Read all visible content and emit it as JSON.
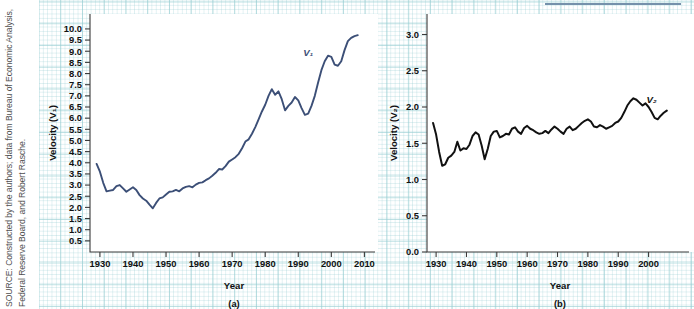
{
  "source_note": "SOURCE: Constructed by the authors; data from Bureau of Economic Analysis, Federal Reserve Board, and Robert Rasche.",
  "panel_a": {
    "subcaption": "(a)",
    "series_label": "V₁",
    "series_color": "#3c4f77"
  },
  "panel_b": {
    "subcaption": "(b)",
    "series_label": "V₂",
    "series_color": "#111111"
  },
  "top_rule_color": "#7591ab",
  "chart_data": [
    {
      "type": "line",
      "panel": "(a)",
      "title": "",
      "xlabel": "Year",
      "ylabel": "Velocity (V₁)",
      "xlim": [
        1927,
        2012
      ],
      "ylim": [
        0,
        10.4
      ],
      "xticks": [
        1930,
        1940,
        1950,
        1960,
        1970,
        1980,
        1990,
        2000,
        2010
      ],
      "yticks": [
        0.5,
        1.0,
        1.5,
        2.0,
        2.5,
        3.0,
        3.5,
        4.0,
        4.5,
        5.0,
        5.5,
        6.0,
        6.5,
        7.0,
        7.5,
        8.0,
        8.5,
        9.0,
        9.5,
        10.0
      ],
      "grid": true,
      "legend": "annotation",
      "annotations": [
        {
          "text": "V₁",
          "x": 1993,
          "y": 8.8
        }
      ],
      "series": [
        {
          "name": "V₁",
          "color": "#3c4f77",
          "x": [
            1929,
            1930,
            1931,
            1932,
            1933,
            1934,
            1935,
            1936,
            1937,
            1938,
            1939,
            1940,
            1941,
            1942,
            1943,
            1944,
            1945,
            1946,
            1947,
            1948,
            1949,
            1950,
            1951,
            1952,
            1953,
            1954,
            1955,
            1956,
            1957,
            1958,
            1959,
            1960,
            1961,
            1962,
            1963,
            1964,
            1965,
            1966,
            1967,
            1968,
            1969,
            1970,
            1971,
            1972,
            1973,
            1974,
            1975,
            1976,
            1977,
            1978,
            1979,
            1980,
            1981,
            1982,
            1983,
            1984,
            1985,
            1986,
            1987,
            1988,
            1989,
            1990,
            1991,
            1992,
            1993,
            1994,
            1995,
            1996,
            1997,
            1998,
            1999,
            2000,
            2001,
            2002,
            2003,
            2004,
            2005,
            2006,
            2007,
            2008
          ],
          "values": [
            3.95,
            3.6,
            3.1,
            2.72,
            2.75,
            2.78,
            2.95,
            3.0,
            2.85,
            2.7,
            2.8,
            2.9,
            2.78,
            2.55,
            2.4,
            2.3,
            2.12,
            1.96,
            2.2,
            2.4,
            2.45,
            2.58,
            2.7,
            2.72,
            2.78,
            2.72,
            2.85,
            2.92,
            2.95,
            2.9,
            3.02,
            3.1,
            3.12,
            3.22,
            3.3,
            3.42,
            3.55,
            3.72,
            3.7,
            3.85,
            4.05,
            4.15,
            4.25,
            4.4,
            4.65,
            4.95,
            5.05,
            5.3,
            5.6,
            5.95,
            6.3,
            6.6,
            7.0,
            7.3,
            7.05,
            7.2,
            6.85,
            6.35,
            6.55,
            6.7,
            6.95,
            6.8,
            6.45,
            6.15,
            6.2,
            6.55,
            7.0,
            7.6,
            8.15,
            8.55,
            8.8,
            8.75,
            8.4,
            8.35,
            8.55,
            9.05,
            9.45,
            9.6,
            9.68,
            9.72
          ]
        }
      ]
    },
    {
      "type": "line",
      "panel": "(b)",
      "title": "",
      "xlabel": "Year",
      "ylabel": "Velocity (V₂)",
      "xlim": [
        1927,
        2012
      ],
      "ylim": [
        0,
        3.2
      ],
      "xticks": [
        1930,
        1940,
        1950,
        1960,
        1970,
        1980,
        1990,
        2000
      ],
      "yticks": [
        0.0,
        0.5,
        1.0,
        1.5,
        2.0,
        2.5,
        3.0
      ],
      "grid": true,
      "legend": "annotation",
      "annotations": [
        {
          "text": "V₂",
          "x": 2001,
          "y": 2.05
        }
      ],
      "series": [
        {
          "name": "V₂",
          "color": "#111111",
          "x": [
            1929,
            1930,
            1931,
            1932,
            1933,
            1934,
            1935,
            1936,
            1937,
            1938,
            1939,
            1940,
            1941,
            1942,
            1943,
            1944,
            1945,
            1946,
            1947,
            1948,
            1949,
            1950,
            1951,
            1952,
            1953,
            1954,
            1955,
            1956,
            1957,
            1958,
            1959,
            1960,
            1961,
            1962,
            1963,
            1964,
            1965,
            1966,
            1967,
            1968,
            1969,
            1970,
            1971,
            1972,
            1973,
            1974,
            1975,
            1976,
            1977,
            1978,
            1979,
            1980,
            1981,
            1982,
            1983,
            1984,
            1985,
            1986,
            1987,
            1988,
            1989,
            1990,
            1991,
            1992,
            1993,
            1994,
            1995,
            1996,
            1997,
            1998,
            1999,
            2000,
            2001,
            2002,
            2003,
            2004,
            2005,
            2006
          ],
          "values": [
            1.78,
            1.62,
            1.38,
            1.19,
            1.21,
            1.3,
            1.33,
            1.38,
            1.52,
            1.4,
            1.43,
            1.42,
            1.48,
            1.6,
            1.65,
            1.62,
            1.47,
            1.28,
            1.42,
            1.6,
            1.66,
            1.67,
            1.58,
            1.6,
            1.63,
            1.62,
            1.7,
            1.72,
            1.66,
            1.63,
            1.71,
            1.74,
            1.7,
            1.68,
            1.65,
            1.63,
            1.64,
            1.67,
            1.64,
            1.69,
            1.73,
            1.7,
            1.66,
            1.63,
            1.7,
            1.73,
            1.68,
            1.7,
            1.74,
            1.78,
            1.81,
            1.83,
            1.8,
            1.73,
            1.72,
            1.75,
            1.73,
            1.7,
            1.72,
            1.74,
            1.78,
            1.8,
            1.85,
            1.93,
            2.02,
            2.08,
            2.12,
            2.1,
            2.06,
            2.02,
            2.05,
            2.0,
            1.93,
            1.85,
            1.83,
            1.88,
            1.92,
            1.95
          ]
        }
      ]
    }
  ]
}
